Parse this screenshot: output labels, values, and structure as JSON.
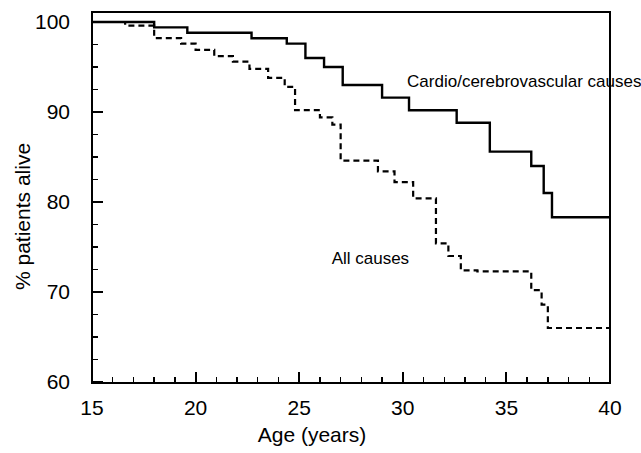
{
  "chart_data": {
    "type": "line",
    "subtype": "kaplan-meier-step",
    "title": "",
    "xlabel": "Age (years)",
    "ylabel": "% patients alive",
    "xlim": [
      15,
      40
    ],
    "ylim": [
      60,
      100
    ],
    "xticks": [
      15,
      20,
      25,
      30,
      35,
      40
    ],
    "xtick_labels": [
      "15",
      "20",
      "25",
      "30",
      "35",
      "40"
    ],
    "x_minor_tick_interval": 1,
    "yticks": [
      60,
      70,
      80,
      90,
      100
    ],
    "ytick_labels": [
      "60",
      "70",
      "80",
      "90",
      "100"
    ],
    "y_minor_tick_interval": 2.5,
    "grid": false,
    "legend_position": "inline-annotation",
    "frame": "box",
    "series": [
      {
        "name": "Cardio/cerebrovascular causes",
        "style": "solid",
        "color": "#000000",
        "annotation_x": 30.4,
        "annotation_y": 93.5,
        "points": [
          [
            15.0,
            100.0
          ],
          [
            18.0,
            100.0
          ],
          [
            18.0,
            99.4
          ],
          [
            19.6,
            99.4
          ],
          [
            19.6,
            98.8
          ],
          [
            22.7,
            98.8
          ],
          [
            22.7,
            98.2
          ],
          [
            24.4,
            98.2
          ],
          [
            24.4,
            97.6
          ],
          [
            25.3,
            97.6
          ],
          [
            25.3,
            96.0
          ],
          [
            26.2,
            96.0
          ],
          [
            26.2,
            95.0
          ],
          [
            27.1,
            95.0
          ],
          [
            27.1,
            93.0
          ],
          [
            29.0,
            93.0
          ],
          [
            29.0,
            91.6
          ],
          [
            30.3,
            91.6
          ],
          [
            30.3,
            90.2
          ],
          [
            32.6,
            90.2
          ],
          [
            32.6,
            88.8
          ],
          [
            34.2,
            88.8
          ],
          [
            34.2,
            85.6
          ],
          [
            36.2,
            85.6
          ],
          [
            36.2,
            84.0
          ],
          [
            36.8,
            84.0
          ],
          [
            36.8,
            81.0
          ],
          [
            37.2,
            81.0
          ],
          [
            37.2,
            78.3
          ],
          [
            40.0,
            78.3
          ]
        ]
      },
      {
        "name": "All causes",
        "style": "dashed",
        "color": "#000000",
        "annotation_x": 28.4,
        "annotation_y": 73.8,
        "points": [
          [
            15.0,
            100.0
          ],
          [
            16.6,
            100.0
          ],
          [
            16.6,
            99.6
          ],
          [
            18.0,
            99.6
          ],
          [
            18.0,
            98.2
          ],
          [
            19.3,
            98.2
          ],
          [
            19.3,
            97.6
          ],
          [
            20.0,
            97.6
          ],
          [
            20.0,
            96.9
          ],
          [
            20.9,
            96.9
          ],
          [
            20.9,
            96.2
          ],
          [
            21.8,
            96.2
          ],
          [
            21.8,
            95.6
          ],
          [
            22.6,
            95.6
          ],
          [
            22.6,
            94.8
          ],
          [
            23.5,
            94.8
          ],
          [
            23.5,
            93.8
          ],
          [
            24.3,
            93.8
          ],
          [
            24.3,
            92.8
          ],
          [
            24.8,
            92.8
          ],
          [
            24.8,
            90.2
          ],
          [
            26.0,
            90.2
          ],
          [
            26.0,
            89.4
          ],
          [
            26.6,
            89.4
          ],
          [
            26.6,
            88.6
          ],
          [
            27.0,
            88.6
          ],
          [
            27.0,
            84.6
          ],
          [
            28.8,
            84.6
          ],
          [
            28.8,
            83.4
          ],
          [
            29.6,
            83.4
          ],
          [
            29.6,
            82.2
          ],
          [
            30.5,
            82.2
          ],
          [
            30.5,
            80.4
          ],
          [
            31.6,
            80.4
          ],
          [
            31.6,
            75.4
          ],
          [
            32.2,
            75.4
          ],
          [
            32.2,
            74.0
          ],
          [
            32.8,
            74.0
          ],
          [
            32.8,
            72.4
          ],
          [
            33.6,
            72.4
          ],
          [
            33.6,
            72.3
          ],
          [
            36.2,
            72.3
          ],
          [
            36.2,
            70.2
          ],
          [
            36.7,
            70.2
          ],
          [
            36.7,
            68.6
          ],
          [
            37.0,
            68.6
          ],
          [
            37.0,
            66.0
          ],
          [
            40.0,
            66.0
          ]
        ]
      }
    ]
  },
  "axes": {
    "x_title": "Age (years)",
    "y_title": "% patients alive",
    "x_tick_labels": [
      "15",
      "20",
      "25",
      "30",
      "35",
      "40"
    ],
    "y_tick_labels": [
      "100",
      "90",
      "80",
      "70",
      "60"
    ]
  },
  "annotations": {
    "solid_label": "Cardio/cerebrovascular causes",
    "dashed_label": "All causes"
  }
}
